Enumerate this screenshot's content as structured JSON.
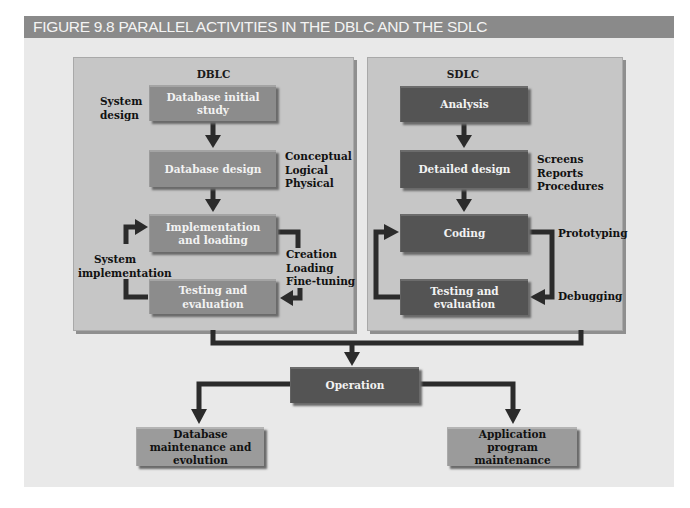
{
  "figure": {
    "title": "FIGURE 9.8  PARALLEL ACTIVITIES IN THE DBLC AND THE SDLC"
  },
  "dblc": {
    "title": "DBLC",
    "boxes": [
      {
        "label": "Database initial study"
      },
      {
        "label": "Database design"
      },
      {
        "label": "Implementation and loading"
      },
      {
        "label": "Testing and evaluation"
      }
    ],
    "annotations": {
      "system_design": "System design",
      "design_levels": [
        "Conceptual",
        "Logical",
        "Physical"
      ],
      "system_implementation": "System implementation",
      "implementation_steps": [
        "Creation",
        "Loading",
        "Fine-tuning"
      ]
    }
  },
  "sdlc": {
    "title": "SDLC",
    "boxes": [
      {
        "label": "Analysis"
      },
      {
        "label": "Detailed design"
      },
      {
        "label": "Coding"
      },
      {
        "label": "Testing and evaluation"
      }
    ],
    "annotations": {
      "design_items": [
        "Screens",
        "Reports",
        "Procedures"
      ],
      "prototyping": "Prototyping",
      "debugging": "Debugging"
    }
  },
  "shared": {
    "operation": "Operation",
    "db_maintenance": "Database maintenance and evolution",
    "app_maintenance": "Application program maintenance"
  },
  "colors": {
    "header": "#8a8a8a",
    "background": "#e9e9e9",
    "panel": "#c6c6c6",
    "box_light": "#8c8c8c",
    "box_dark": "#545454",
    "arrow": "#2b2b2b"
  }
}
